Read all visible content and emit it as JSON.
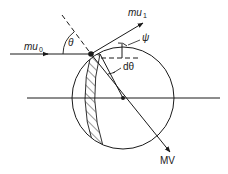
{
  "diagram": {
    "labels": {
      "incoming_momentum": "mu",
      "incoming_sub": "0",
      "outgoing_momentum": "mu",
      "outgoing_sub": "1",
      "incidence_angle": "θ",
      "deflection_angle": "ψ",
      "angle_increment": "dθ",
      "target_momentum": "MV"
    },
    "colors": {
      "stroke": "#1a1a1a",
      "background": "#ffffff"
    }
  }
}
